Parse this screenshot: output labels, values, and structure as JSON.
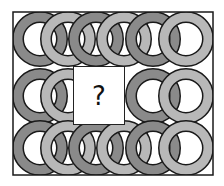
{
  "puzzle": {
    "question_mark": "?",
    "colors": {
      "dark_ring": "#8a8a8a",
      "light_ring": "#b8b8b8",
      "outline": "#1a1a1a",
      "background": "#ffffff"
    },
    "rows": [
      {
        "name": "top",
        "cy": 39,
        "rings": [
          {
            "cx": 40,
            "shade": "dark"
          },
          {
            "cx": 68,
            "shade": "light"
          },
          {
            "cx": 96,
            "shade": "dark"
          },
          {
            "cx": 124,
            "shade": "light"
          },
          {
            "cx": 153,
            "shade": "dark"
          },
          {
            "cx": 186,
            "shade": "light"
          }
        ]
      },
      {
        "name": "middle",
        "cy": 96,
        "rings": [
          {
            "cx": 40,
            "shade": "dark"
          },
          {
            "cx": 68,
            "shade": "light"
          },
          {
            "cx": 153,
            "shade": "dark"
          },
          {
            "cx": 186,
            "shade": "light"
          }
        ]
      },
      {
        "name": "bottom",
        "cy": 148,
        "rings": [
          {
            "cx": 40,
            "shade": "dark"
          },
          {
            "cx": 68,
            "shade": "light"
          },
          {
            "cx": 96,
            "shade": "dark"
          },
          {
            "cx": 124,
            "shade": "light"
          },
          {
            "cx": 153,
            "shade": "dark"
          },
          {
            "cx": 186,
            "shade": "light"
          }
        ]
      }
    ]
  }
}
